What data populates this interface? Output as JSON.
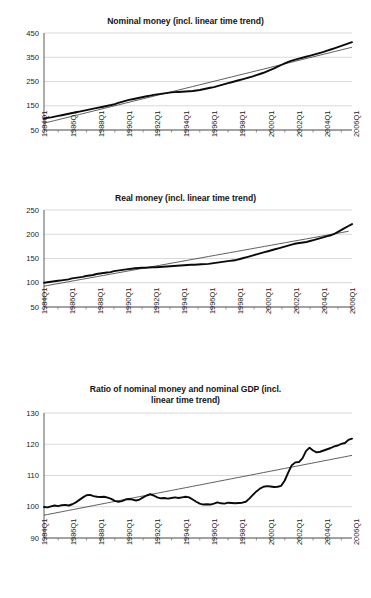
{
  "figure": {
    "background": "#ffffff",
    "line_color": "#0a0a0a",
    "trend_color": "#2a2a2a",
    "grid_color": "#c8c8c8"
  },
  "charts": [
    {
      "id": "nominal-money",
      "title": "Nominal money (incl. linear time trend)",
      "chart_index": 0
    },
    {
      "id": "real-money",
      "title": "Real money (incl. linear time trend)",
      "chart_index": 1
    },
    {
      "id": "ratio-nominal-money-gdp",
      "title": "Ratio of nominal money and nominal GDP (incl. linear time trend)",
      "title_line1": "Ratio of nominal money and nominal GDP (incl.",
      "title_line2": "linear time trend)",
      "chart_index": 2
    }
  ],
  "chart_data": [
    {
      "type": "line",
      "title": "Nominal money (incl. linear time trend)",
      "xlabel": "",
      "ylabel": "",
      "ylim": [
        50,
        450
      ],
      "yticks": [
        50,
        150,
        250,
        350,
        450
      ],
      "ytick_labels": [
        "50",
        "150",
        "250",
        "350",
        "450"
      ],
      "grid": true,
      "legend": "none",
      "x_start": "1984Q1",
      "x_end": "2007Q2",
      "x_step_quarters": 1,
      "xticks": [
        "1984Q1",
        "1986Q1",
        "1988Q1",
        "1990Q1",
        "1992Q1",
        "1994Q1",
        "1996Q1",
        "1998Q1",
        "2000Q1",
        "2002Q1",
        "2004Q1",
        "2006Q1"
      ],
      "series": [
        {
          "name": "Nominal money",
          "values": [
            98,
            100,
            102,
            105,
            108,
            111,
            114,
            117,
            120,
            123,
            126,
            129,
            132,
            135,
            138,
            141,
            144,
            147,
            150,
            153,
            157,
            162,
            166,
            170,
            174,
            177,
            180,
            183,
            186,
            189,
            192,
            195,
            197,
            199,
            201,
            203,
            205,
            206,
            207,
            208,
            209,
            210,
            211,
            213,
            215,
            218,
            221,
            224,
            227,
            231,
            235,
            239,
            243,
            247,
            251,
            255,
            259,
            263,
            267,
            271,
            276,
            281,
            286,
            292,
            298,
            304,
            311,
            318,
            325,
            331,
            336,
            340,
            344,
            348,
            352,
            356,
            360,
            364,
            368,
            372,
            377,
            382,
            387,
            392,
            397,
            402,
            407,
            412
          ]
        },
        {
          "name": "Linear time trend",
          "values": [
            78,
            81.6,
            85.2,
            88.8,
            92.4,
            96,
            99.6,
            103.2,
            106.8,
            110.4,
            114,
            117.6,
            121.2,
            124.8,
            128.4,
            132,
            135.6,
            139.2,
            142.8,
            146.4,
            150,
            153.6,
            157.2,
            160.8,
            164.4,
            168,
            171.6,
            175.2,
            178.8,
            182.4,
            186,
            189.6,
            193.2,
            196.8,
            200.4,
            204,
            207.6,
            211.2,
            214.8,
            218.4,
            222,
            225.6,
            229.2,
            232.8,
            236.4,
            240,
            243.6,
            247.2,
            250.8,
            254.4,
            258,
            261.6,
            265.2,
            268.8,
            272.4,
            276,
            279.6,
            283.2,
            286.8,
            290.4,
            294,
            297.6,
            301.2,
            304.8,
            308.4,
            312,
            315.6,
            319.2,
            322.8,
            326.4,
            330,
            333.6,
            337.2,
            340.8,
            344.4,
            348,
            351.6,
            355.2,
            358.8,
            362.4,
            366,
            369.6,
            373.2,
            376.8,
            380.4,
            384,
            387.6,
            391.2
          ]
        }
      ]
    },
    {
      "type": "line",
      "title": "Real money (incl. linear time trend)",
      "xlabel": "",
      "ylabel": "",
      "ylim": [
        50,
        250
      ],
      "yticks": [
        50,
        100,
        150,
        200,
        250
      ],
      "ytick_labels": [
        "50",
        "100",
        "150",
        "200",
        "250"
      ],
      "grid": true,
      "legend": "none",
      "x_start": "1984Q1",
      "x_end": "2007Q2",
      "x_step_quarters": 1,
      "xticks": [
        "1984Q1",
        "1986Q1",
        "1988Q1",
        "1990Q1",
        "1992Q1",
        "1994Q1",
        "1996Q1",
        "1998Q1",
        "2000Q1",
        "2002Q1",
        "2004Q1",
        "2006Q1"
      ],
      "series": [
        {
          "name": "Real money",
          "values": [
            100,
            101,
            102,
            103,
            104,
            105,
            106,
            107,
            109,
            110,
            111,
            112,
            114,
            115,
            116,
            118,
            119,
            120,
            121,
            122,
            124,
            125,
            126,
            127,
            128,
            129,
            130,
            130.5,
            131,
            131,
            131.5,
            132,
            132,
            132.5,
            133,
            133.5,
            134,
            134.5,
            135,
            135.5,
            136,
            136.5,
            137,
            137,
            137.5,
            138,
            138.5,
            139,
            140,
            141,
            142,
            143,
            144,
            145,
            146,
            147,
            149,
            151,
            153,
            155,
            157,
            159,
            161,
            163,
            165,
            167,
            169,
            171,
            173,
            175,
            177,
            179,
            181,
            182,
            183,
            184,
            186,
            188,
            190,
            192,
            194,
            196,
            198,
            201,
            205,
            209,
            213,
            217,
            221
          ]
        },
        {
          "name": "Linear time trend",
          "values": [
            93,
            94.3,
            95.6,
            96.9,
            98.2,
            99.5,
            100.8,
            102.1,
            103.4,
            104.7,
            106,
            107.3,
            108.6,
            109.9,
            111.2,
            112.5,
            113.8,
            115.1,
            116.4,
            117.7,
            119,
            120.3,
            121.6,
            122.9,
            124.2,
            125.5,
            126.8,
            128.1,
            129.4,
            130.7,
            132,
            133.3,
            134.6,
            135.9,
            137.2,
            138.5,
            139.8,
            141.1,
            142.4,
            143.7,
            145,
            146.3,
            147.6,
            148.9,
            150.2,
            151.5,
            152.8,
            154.1,
            155.4,
            156.7,
            158,
            159.3,
            160.6,
            161.9,
            163.2,
            164.5,
            165.8,
            167.1,
            168.4,
            169.7,
            171,
            172.3,
            173.6,
            174.9,
            176.2,
            177.5,
            178.8,
            180.1,
            181.4,
            182.7,
            184,
            185.3,
            186.6,
            187.9,
            189.2,
            190.5,
            191.8,
            193.1,
            194.4,
            195.7,
            197,
            198.3,
            199.6,
            200.9,
            202.2,
            203.5,
            204.8,
            206.1
          ]
        }
      ]
    },
    {
      "type": "line",
      "title": "Ratio of nominal money and nominal GDP (incl. linear time trend)",
      "xlabel": "",
      "ylabel": "",
      "ylim": [
        90,
        130
      ],
      "yticks": [
        90,
        100,
        110,
        120,
        130
      ],
      "ytick_labels": [
        "90",
        "100",
        "110",
        "120",
        "130"
      ],
      "grid": true,
      "legend": "none",
      "x_start": "1984Q1",
      "x_end": "2007Q2",
      "x_step_quarters": 1,
      "xticks": [
        "1984Q1",
        "1986Q1",
        "1988Q1",
        "1990Q1",
        "1992Q1",
        "1994Q1",
        "1996Q1",
        "1998Q1",
        "2000Q1",
        "2002Q1",
        "2004Q1",
        "2006Q1"
      ],
      "series": [
        {
          "name": "Ratio of nominal money to nominal GDP",
          "values": [
            99.9,
            99.8,
            100.1,
            100.4,
            100.2,
            100.5,
            100.6,
            100.4,
            100.8,
            101.4,
            102.2,
            103.0,
            103.7,
            103.8,
            103.4,
            103.2,
            103.1,
            103.2,
            102.9,
            102.5,
            101.9,
            101.6,
            101.8,
            102.3,
            102.5,
            102.3,
            102.0,
            102.3,
            103.0,
            103.6,
            104.0,
            103.6,
            103.0,
            102.7,
            102.8,
            102.6,
            102.8,
            103.0,
            102.8,
            103.0,
            103.2,
            103.0,
            102.3,
            101.6,
            101.0,
            100.7,
            100.8,
            100.7,
            101.0,
            101.4,
            101.1,
            101.0,
            101.3,
            101.2,
            101.1,
            101.2,
            101.3,
            101.6,
            102.6,
            103.8,
            104.9,
            105.8,
            106.4,
            106.6,
            106.5,
            106.3,
            106.4,
            106.7,
            108.4,
            111.0,
            113.3,
            114.2,
            114.3,
            115.5,
            117.8,
            118.9,
            118.0,
            117.4,
            117.6,
            118.0,
            118.4,
            118.8,
            119.3,
            119.6,
            120.1,
            120.4,
            121.4,
            121.8
          ]
        },
        {
          "name": "Linear time trend",
          "values": [
            97.3,
            97.52,
            97.74,
            97.96,
            98.18,
            98.4,
            98.62,
            98.84,
            99.06,
            99.28,
            99.5,
            99.72,
            99.94,
            100.16,
            100.38,
            100.6,
            100.82,
            101.04,
            101.26,
            101.48,
            101.7,
            101.92,
            102.14,
            102.36,
            102.58,
            102.8,
            103.02,
            103.24,
            103.46,
            103.68,
            103.9,
            104.12,
            104.34,
            104.56,
            104.78,
            105,
            105.22,
            105.44,
            105.66,
            105.88,
            106.1,
            106.32,
            106.54,
            106.76,
            106.98,
            107.2,
            107.42,
            107.64,
            107.86,
            108.08,
            108.3,
            108.52,
            108.74,
            108.96,
            109.18,
            109.4,
            109.62,
            109.84,
            110.06,
            110.28,
            110.5,
            110.72,
            110.94,
            111.16,
            111.38,
            111.6,
            111.82,
            112.04,
            112.26,
            112.48,
            112.7,
            112.92,
            113.14,
            113.36,
            113.58,
            113.8,
            114.02,
            114.24,
            114.46,
            114.68,
            114.9,
            115.12,
            115.34,
            115.56,
            115.78,
            116,
            116.22,
            116.44
          ]
        }
      ]
    }
  ]
}
